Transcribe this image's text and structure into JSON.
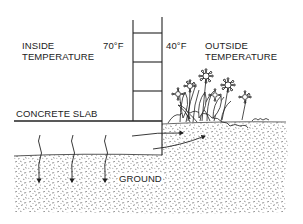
{
  "labels": {
    "inside_line1": "INSIDE",
    "inside_line2": "TEMPERATURE",
    "inside_temp": "70°F",
    "outside_temp": "40°F",
    "outside_line1": "OUTSIDE",
    "outside_line2": "TEMPERATURE",
    "slab": "CONCRETE SLAB",
    "ground": "GROUND"
  },
  "colors": {
    "ink": "#222222",
    "gravel": "#8a8a8a",
    "background": "#ffffff"
  }
}
